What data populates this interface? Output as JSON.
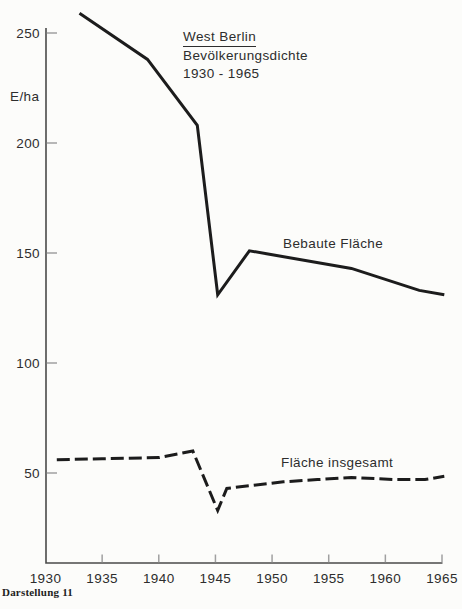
{
  "figure": {
    "title_line1": "West Berlin",
    "title_line2": "Bevölkerungsdichte",
    "title_line3": "1930 - 1965",
    "y_unit": "E/ha",
    "caption": "Darstellung 11"
  },
  "chart_data": {
    "type": "line",
    "title": "West Berlin Bevölkerungsdichte 1930 - 1965",
    "xlabel": "",
    "ylabel": "E/ha",
    "x_ticks": [
      1930,
      1935,
      1940,
      1945,
      1950,
      1955,
      1960,
      1965
    ],
    "y_ticks": [
      50,
      100,
      150,
      200,
      250
    ],
    "xlim": [
      1930,
      1965
    ],
    "ylim": [
      9,
      262
    ],
    "grid": false,
    "legend_position": "inline-labels",
    "series": [
      {
        "name": "Bebaute Fläche",
        "style": "solid",
        "points": [
          [
            1933,
            259
          ],
          [
            1939,
            238
          ],
          [
            1943.4,
            208
          ],
          [
            1945.2,
            131
          ],
          [
            1948,
            151
          ],
          [
            1957,
            143
          ],
          [
            1963,
            133
          ],
          [
            1965.2,
            131
          ]
        ]
      },
      {
        "name": "Fläche insgesamt",
        "style": "dashed",
        "points": [
          [
            1931,
            56
          ],
          [
            1935,
            56.5
          ],
          [
            1940,
            57
          ],
          [
            1943,
            60
          ],
          [
            1945.2,
            33
          ],
          [
            1946,
            43
          ],
          [
            1951,
            46
          ],
          [
            1954,
            47
          ],
          [
            1957,
            48
          ],
          [
            1961,
            47
          ],
          [
            1963.5,
            47
          ],
          [
            1965.2,
            48.5
          ]
        ]
      }
    ]
  },
  "colors": {
    "background": "#fcfcfa",
    "line": "#1c1c1c",
    "axis": "#4a4a4a",
    "tick": "#a0a0a0",
    "text": "#2d2d2d"
  }
}
